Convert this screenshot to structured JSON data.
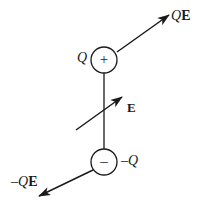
{
  "figure": {
    "background_color": "#ffffff",
    "stroke_color": "#1a1a1a",
    "width": 203,
    "height": 202
  },
  "charges": {
    "positive": {
      "label": "Q",
      "sign_glyph": "+",
      "center_x": 104,
      "center_y": 60,
      "radius": 13
    },
    "negative": {
      "label_minus": "–",
      "label_q": "Q",
      "sign_glyph": "–",
      "center_x": 104,
      "center_y": 162,
      "radius": 13
    }
  },
  "force_vectors": {
    "top": {
      "label_q": "Q",
      "label_e": "E",
      "from_x": 117,
      "from_y": 52,
      "to_x": 172,
      "to_y": 13
    },
    "bottom": {
      "label_minus": "–",
      "label_q": "Q",
      "label_e": "E",
      "from_x": 93,
      "from_y": 170,
      "to_x": 36,
      "to_y": 198
    }
  },
  "field_vector": {
    "label": "E",
    "from_x": 76,
    "from_y": 130,
    "to_x": 125,
    "to_y": 95
  },
  "dipole_axis": {
    "x": 104,
    "from_y": 73,
    "to_y": 149
  }
}
